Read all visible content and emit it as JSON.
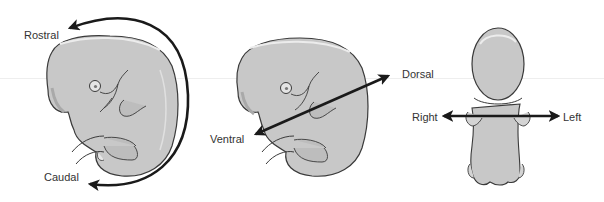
{
  "diagram": {
    "type": "anatomical-orientation",
    "colors": {
      "embryo_fill": "#c8c8c8",
      "embryo_shadow": "#a9a9a9",
      "embryo_highlight": "#e6e6e6",
      "outline": "#3a3a3a",
      "arrow": "#1a1a1a",
      "label": "#333333"
    },
    "panels": [
      {
        "name": "lateral-view-rostral-caudal",
        "labels": {
          "top": "Rostral",
          "bottom": "Caudal"
        },
        "arrow": "curved-double-headed"
      },
      {
        "name": "lateral-view-dorsal-ventral",
        "labels": {
          "end": "Dorsal",
          "start": "Ventral"
        },
        "arrow": "diagonal-double-headed"
      },
      {
        "name": "dorsal-view-right-left",
        "labels": {
          "start": "Right",
          "end": "Left"
        },
        "arrow": "horizontal-double-headed"
      }
    ]
  }
}
